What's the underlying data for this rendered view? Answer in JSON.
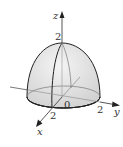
{
  "diagram": {
    "shape": "upper-hemisphere",
    "radius": 2,
    "axes": {
      "x": {
        "label": "x",
        "tick_label": "2"
      },
      "y": {
        "label": "y",
        "tick_label": "2"
      },
      "z": {
        "label": "z",
        "tick_label": "2"
      },
      "origin_label": "0"
    },
    "colors": {
      "surface_fill": "#d9d9d9",
      "surface_highlight": "#f2f2f2",
      "stroke": "#222222",
      "axis": "#444444"
    }
  }
}
